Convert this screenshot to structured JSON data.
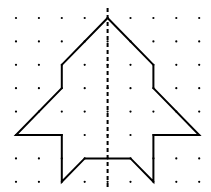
{
  "diagram": {
    "type": "dot-grid-symmetry",
    "grid": {
      "columns": 9,
      "rows": 8,
      "origin_x": 16,
      "origin_y": 18,
      "spacing_x": 22.9,
      "spacing_y": 23.4,
      "dot_color": "#000000"
    },
    "shape": {
      "stroke": "#000000",
      "vertices_grid": [
        [
          4,
          0
        ],
        [
          6,
          2
        ],
        [
          6,
          3
        ],
        [
          8,
          5
        ],
        [
          6,
          5
        ],
        [
          6,
          7
        ],
        [
          5,
          6
        ],
        [
          3,
          6
        ],
        [
          2,
          7
        ],
        [
          2,
          5
        ],
        [
          0,
          5
        ],
        [
          2,
          3
        ],
        [
          2,
          2
        ]
      ]
    },
    "symmetry_line": {
      "style": "dashed",
      "x_grid": 4,
      "color": "#000000"
    }
  }
}
